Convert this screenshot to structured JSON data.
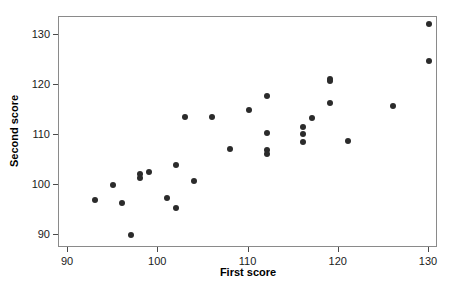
{
  "chart_data": {
    "type": "scatter",
    "title": "",
    "xlabel": "First score",
    "ylabel": "Second score",
    "xlim": [
      89.0,
      131.0
    ],
    "ylim": [
      87.5,
      133.5
    ],
    "xticks": [
      90,
      100,
      110,
      120,
      130
    ],
    "yticks": [
      90,
      100,
      110,
      120,
      130
    ],
    "xtick_labels": [
      "90",
      "100",
      "110",
      "120",
      "130"
    ],
    "ytick_labels": [
      "90",
      "100",
      "110",
      "120",
      "130"
    ],
    "grid": false,
    "legend": null,
    "marker": {
      "shape": "circle",
      "color": "#2b2b2b",
      "size": 6
    },
    "frame": {
      "border_color": "#8a8a8a",
      "background": "#ffffff"
    },
    "n_points": 30,
    "points": [
      {
        "x": 93,
        "y": 97.1
      },
      {
        "x": 95,
        "y": 100.0
      },
      {
        "x": 96,
        "y": 96.5
      },
      {
        "x": 97,
        "y": 90.0
      },
      {
        "x": 98,
        "y": 102.3
      },
      {
        "x": 98,
        "y": 101.5
      },
      {
        "x": 99,
        "y": 102.7
      },
      {
        "x": 101,
        "y": 97.5
      },
      {
        "x": 102,
        "y": 104.0
      },
      {
        "x": 102,
        "y": 95.5
      },
      {
        "x": 103,
        "y": 113.5
      },
      {
        "x": 104,
        "y": 100.9
      },
      {
        "x": 106,
        "y": 113.5
      },
      {
        "x": 108,
        "y": 107.2
      },
      {
        "x": 110,
        "y": 115.0
      },
      {
        "x": 112,
        "y": 117.8
      },
      {
        "x": 112,
        "y": 110.4
      },
      {
        "x": 112,
        "y": 107.0
      },
      {
        "x": 112,
        "y": 106.3
      },
      {
        "x": 116,
        "y": 111.6
      },
      {
        "x": 116,
        "y": 110.2
      },
      {
        "x": 116,
        "y": 108.7
      },
      {
        "x": 117,
        "y": 113.4
      },
      {
        "x": 119,
        "y": 121.2
      },
      {
        "x": 119,
        "y": 120.7
      },
      {
        "x": 119,
        "y": 116.3
      },
      {
        "x": 121,
        "y": 108.8
      },
      {
        "x": 126,
        "y": 115.7
      },
      {
        "x": 130,
        "y": 132.2
      },
      {
        "x": 130,
        "y": 124.8
      }
    ]
  }
}
